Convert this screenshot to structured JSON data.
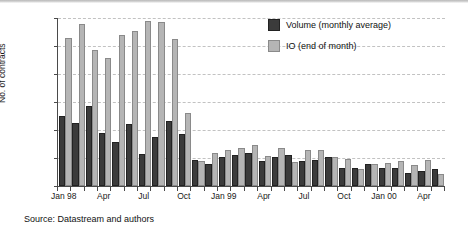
{
  "chart_data": {
    "type": "bar",
    "title": "",
    "xlabel": "",
    "ylabel": "No. of contracts",
    "ylim": [
      0,
      120000
    ],
    "yticks": [
      "0",
      "20000",
      "40000",
      "60000",
      "80000",
      "100000",
      "120000"
    ],
    "ytick_values": [
      0,
      20000,
      40000,
      60000,
      80000,
      100000,
      120000
    ],
    "grid": true,
    "legend_position": "top-right",
    "categories": [
      "Jan 98",
      "Feb 98",
      "Mar 98",
      "Apr 98",
      "May 98",
      "Jun 98",
      "Jul 98",
      "Aug 98",
      "Sep 98",
      "Oct 98",
      "Nov 98",
      "Dec 98",
      "Jan 99",
      "Feb 99",
      "Mar 99",
      "Apr 99",
      "May 99",
      "Jun 99",
      "Jul 99",
      "Aug 99",
      "Sep 99",
      "Oct 99",
      "Nov 99",
      "Dec 99",
      "Jan 00",
      "Feb 00",
      "Mar 00",
      "Apr 00",
      "May 00"
    ],
    "series": [
      {
        "name": "Volume (monthly average)",
        "color": "#3b3b3b",
        "values": [
          50000,
          44800,
          57000,
          38200,
          31200,
          44400,
          22800,
          35000,
          46600,
          37400,
          18800,
          15600,
          20800,
          22400,
          23600,
          18000,
          20400,
          22000,
          18200,
          18600,
          21000,
          13200,
          12600,
          15600,
          13000,
          13200,
          9600,
          10800,
          12200
        ]
      },
      {
        "name": "IO (end of month)",
        "color": "#b5b5b5",
        "values": [
          106000,
          116000,
          97500,
          91500,
          108000,
          111000,
          118000,
          117000,
          105000,
          52000,
          18200,
          23400,
          25600,
          27000,
          29000,
          21600,
          27400,
          17400,
          25600,
          26000,
          20800,
          19200,
          11800,
          16000,
          16400,
          18000,
          15000,
          18600,
          8800
        ]
      }
    ],
    "xticks": [
      {
        "label": "Jan 98",
        "index": 0
      },
      {
        "label": "Apr",
        "index": 3
      },
      {
        "label": "Jul",
        "index": 6
      },
      {
        "label": "Oct",
        "index": 9
      },
      {
        "label": "Jan 99",
        "index": 12
      },
      {
        "label": "Apr",
        "index": 15
      },
      {
        "label": "Jul",
        "index": 18
      },
      {
        "label": "Oct",
        "index": 21
      },
      {
        "label": "Jan 00",
        "index": 24
      },
      {
        "label": "Apr",
        "index": 27
      }
    ]
  },
  "legend": {
    "items": [
      {
        "label": "Volume (monthly average)",
        "swatch": "vol"
      },
      {
        "label": "IO (end of month)",
        "swatch": "io"
      }
    ]
  },
  "axis": {
    "ylabel": "No. of contracts"
  },
  "footer": {
    "source": "Source: Datastream and authors"
  },
  "colors": {
    "volume": "#3b3b3b",
    "io": "#b5b5b5",
    "grid": "#c2c2c2",
    "axis": "#4a4a4a",
    "background": "#ffffff"
  }
}
